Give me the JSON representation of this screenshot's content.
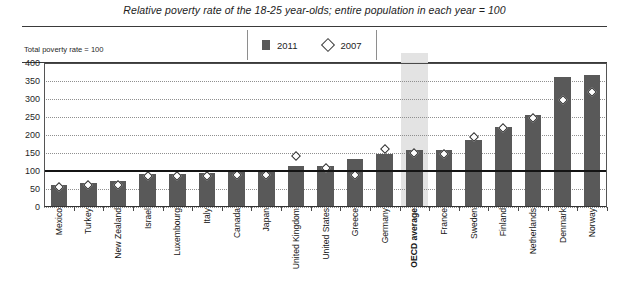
{
  "chart_data": {
    "type": "bar",
    "title": "Relative poverty rate of the 18-25 year-olds; entire population in each year = 100",
    "subtitle": "",
    "xlabel": "",
    "ylabel": "",
    "axis_note": "Total poverty rate = 100",
    "ylim": [
      0,
      400
    ],
    "yticks": [
      0,
      50,
      100,
      150,
      200,
      250,
      300,
      350,
      400
    ],
    "ytick_labels": [
      "0",
      "50",
      "100",
      "150",
      "200",
      "250",
      "300",
      "350",
      "400"
    ],
    "grid": true,
    "legend_position": "top-center",
    "reference_line": 100,
    "highlight_category": "OECD average",
    "categories": [
      "Mexico",
      "Turkey",
      "New Zealand",
      "Israel",
      "Luxembourg",
      "Italy",
      "Canada",
      "Japan",
      "United Kingdom",
      "United States",
      "Greece",
      "Germany",
      "OECD average",
      "France",
      "Sweden",
      "Finland",
      "Netherlands",
      "Denmark",
      "Norway"
    ],
    "series": [
      {
        "name": "2011",
        "marker": "bar",
        "color": "#595959",
        "values": [
          62,
          68,
          72,
          92,
          93,
          95,
          98,
          100,
          113,
          115,
          132,
          148,
          157,
          158,
          185,
          222,
          255,
          360,
          368
        ]
      },
      {
        "name": "2007",
        "marker": "diamond",
        "color": "#ffffff",
        "values": [
          65,
          70,
          70,
          95,
          97,
          97,
          100,
          100,
          152,
          118,
          100,
          172,
          160,
          157,
          203,
          228,
          258,
          307,
          330
        ]
      }
    ]
  },
  "legend": {
    "entries": [
      {
        "label": "2011",
        "swatch": "bar-swatch"
      },
      {
        "label": "2007",
        "swatch": "diamond-swatch"
      }
    ]
  }
}
